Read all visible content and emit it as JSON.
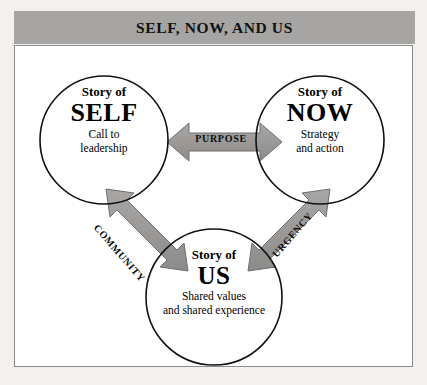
{
  "figure": {
    "title": "SELF, NOW, AND US",
    "band_color": "#a6a5a3",
    "frame_border_color": "#8d8c8a",
    "page_background": "#f3f1ee",
    "arrow_fill": "#9c9b99",
    "arrow_stroke": "#6f6e6c",
    "circle_stroke": "#111111"
  },
  "nodes": [
    {
      "id": "self",
      "kicker": "Story of",
      "headword": "SELF",
      "desc": "Call to\nleadership",
      "desc_line1": "Call to",
      "desc_line2": "leadership"
    },
    {
      "id": "now",
      "kicker": "Story of",
      "headword": "NOW",
      "desc_line1": "Strategy",
      "desc_line2": "and action"
    },
    {
      "id": "us",
      "kicker": "Story of",
      "headword": "US",
      "desc_line1": "Shared values",
      "desc_line2": "and shared experience"
    }
  ],
  "arrows": [
    {
      "id": "purpose",
      "label": "PURPOSE",
      "from": "self",
      "to": "now",
      "style": "double-headed"
    },
    {
      "id": "community",
      "label": "COMMUNITY",
      "from": "self",
      "to": "us",
      "style": "double-headed"
    },
    {
      "id": "urgency",
      "label": "URGENCY",
      "from": "us",
      "to": "now",
      "style": "double-headed"
    }
  ]
}
